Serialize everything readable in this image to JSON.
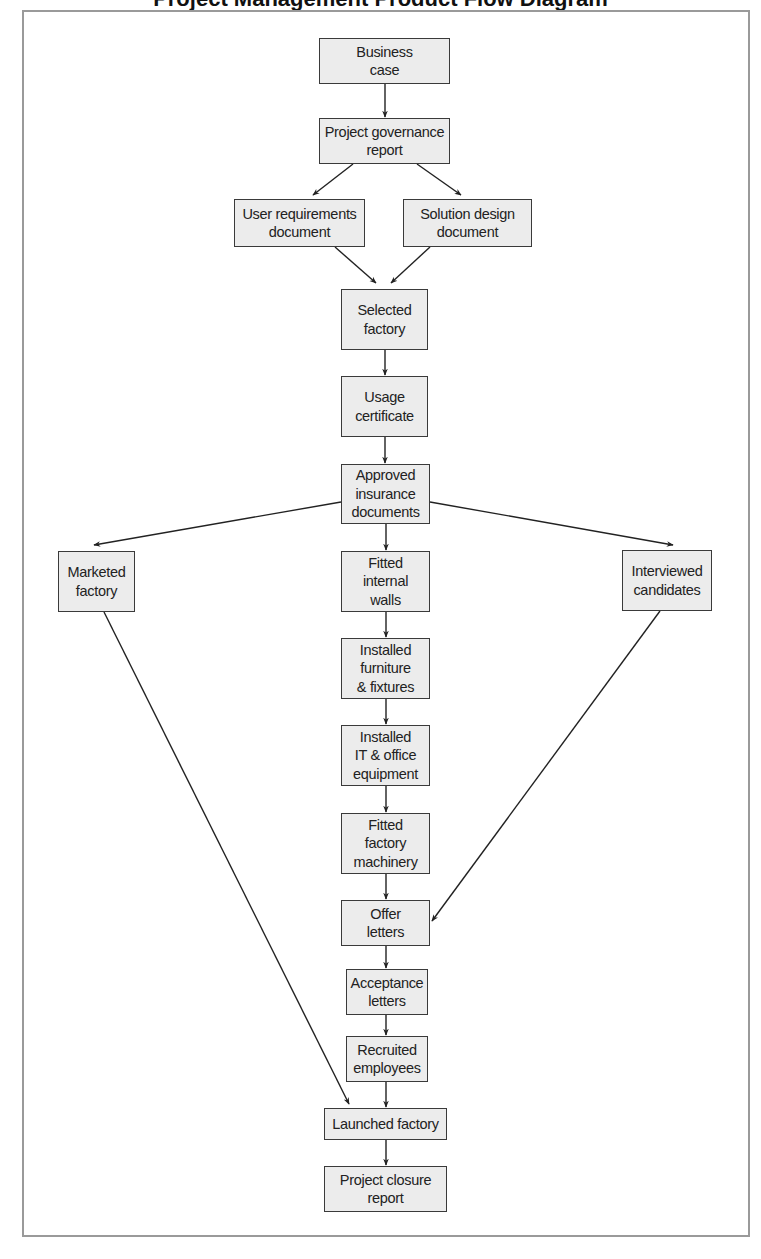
{
  "title": "Project Management Product Flow Diagram",
  "colors": {
    "node_fill": "#ececec",
    "node_border": "#3a3a3a",
    "edge": "#222222",
    "frame": "#9a9a9a"
  },
  "nodes": [
    {
      "id": "business_case",
      "label": "Business\ncase",
      "x": 319,
      "y": 38,
      "w": 131,
      "h": 46
    },
    {
      "id": "project_governance_report",
      "label": "Project governance\nreport",
      "x": 319,
      "y": 118,
      "w": 131,
      "h": 46
    },
    {
      "id": "user_requirements_document",
      "label": "User requirements\ndocument",
      "x": 234,
      "y": 199,
      "w": 131,
      "h": 48
    },
    {
      "id": "solution_design_document",
      "label": "Solution design\ndocument",
      "x": 403,
      "y": 199,
      "w": 129,
      "h": 48
    },
    {
      "id": "selected_factory",
      "label": "Selected\nfactory",
      "x": 341,
      "y": 289,
      "w": 87,
      "h": 61
    },
    {
      "id": "usage_certificate",
      "label": "Usage\ncertificate",
      "x": 341,
      "y": 376,
      "w": 87,
      "h": 61
    },
    {
      "id": "approved_insurance_documents",
      "label": "Approved\ninsurance\ndocuments",
      "x": 341,
      "y": 464,
      "w": 89,
      "h": 60
    },
    {
      "id": "marketed_factory",
      "label": "Marketed\nfactory",
      "x": 58,
      "y": 551,
      "w": 77,
      "h": 61
    },
    {
      "id": "fitted_internal_walls",
      "label": "Fitted\ninternal\nwalls",
      "x": 341,
      "y": 551,
      "w": 89,
      "h": 61
    },
    {
      "id": "interviewed_candidates",
      "label": "Interviewed\ncandidates",
      "x": 622,
      "y": 550,
      "w": 90,
      "h": 61
    },
    {
      "id": "installed_furniture_fixtures",
      "label": "Installed\nfurniture\n& fixtures",
      "x": 341,
      "y": 638,
      "w": 89,
      "h": 61
    },
    {
      "id": "installed_it_office_equipment",
      "label": "Installed\nIT & office\nequipment",
      "x": 341,
      "y": 725,
      "w": 89,
      "h": 61
    },
    {
      "id": "fitted_factory_machinery",
      "label": "Fitted\nfactory\nmachinery",
      "x": 341,
      "y": 813,
      "w": 89,
      "h": 61
    },
    {
      "id": "offer_letters",
      "label": "Offer\nletters",
      "x": 341,
      "y": 900,
      "w": 89,
      "h": 46
    },
    {
      "id": "acceptance_letters",
      "label": "Acceptance\nletters",
      "x": 346,
      "y": 969,
      "w": 82,
      "h": 46
    },
    {
      "id": "recruited_employees",
      "label": "Recruited\nemployees",
      "x": 346,
      "y": 1036,
      "w": 82,
      "h": 46
    },
    {
      "id": "launched_factory",
      "label": "Launched factory",
      "x": 324,
      "y": 1108,
      "w": 123,
      "h": 32
    },
    {
      "id": "project_closure_report",
      "label": "Project closure\nreport",
      "x": 324,
      "y": 1166,
      "w": 123,
      "h": 46
    }
  ],
  "edges": [
    {
      "from": "business_case",
      "to": "project_governance_report",
      "x1": 385,
      "y1": 84,
      "x2": 385,
      "y2": 117
    },
    {
      "from": "project_governance_report",
      "to": "user_requirements_document",
      "x1": 353,
      "y1": 164,
      "x2": 313,
      "y2": 195
    },
    {
      "from": "project_governance_report",
      "to": "solution_design_document",
      "x1": 417,
      "y1": 164,
      "x2": 461,
      "y2": 195
    },
    {
      "from": "user_requirements_document",
      "to": "selected_factory",
      "x1": 335,
      "y1": 247,
      "x2": 376,
      "y2": 283
    },
    {
      "from": "solution_design_document",
      "to": "selected_factory",
      "x1": 430,
      "y1": 247,
      "x2": 391,
      "y2": 283
    },
    {
      "from": "selected_factory",
      "to": "usage_certificate",
      "x1": 385,
      "y1": 350,
      "x2": 385,
      "y2": 375
    },
    {
      "from": "usage_certificate",
      "to": "approved_insurance_documents",
      "x1": 385,
      "y1": 437,
      "x2": 385,
      "y2": 463
    },
    {
      "from": "approved_insurance_documents",
      "to": "marketed_factory",
      "x1": 341,
      "y1": 502,
      "x2": 94,
      "y2": 545
    },
    {
      "from": "approved_insurance_documents",
      "to": "fitted_internal_walls",
      "x1": 386,
      "y1": 524,
      "x2": 386,
      "y2": 550
    },
    {
      "from": "approved_insurance_documents",
      "to": "interviewed_candidates",
      "x1": 430,
      "y1": 502,
      "x2": 673,
      "y2": 545
    },
    {
      "from": "fitted_internal_walls",
      "to": "installed_furniture_fixtures",
      "x1": 386,
      "y1": 612,
      "x2": 386,
      "y2": 637
    },
    {
      "from": "installed_furniture_fixtures",
      "to": "installed_it_office_equipment",
      "x1": 386,
      "y1": 699,
      "x2": 386,
      "y2": 724
    },
    {
      "from": "installed_it_office_equipment",
      "to": "fitted_factory_machinery",
      "x1": 386,
      "y1": 786,
      "x2": 386,
      "y2": 812
    },
    {
      "from": "fitted_factory_machinery",
      "to": "offer_letters",
      "x1": 386,
      "y1": 874,
      "x2": 386,
      "y2": 899
    },
    {
      "from": "interviewed_candidates",
      "to": "offer_letters",
      "x1": 660,
      "y1": 611,
      "x2": 432,
      "y2": 921
    },
    {
      "from": "offer_letters",
      "to": "acceptance_letters",
      "x1": 386,
      "y1": 946,
      "x2": 386,
      "y2": 968
    },
    {
      "from": "acceptance_letters",
      "to": "recruited_employees",
      "x1": 386,
      "y1": 1015,
      "x2": 386,
      "y2": 1035
    },
    {
      "from": "recruited_employees",
      "to": "launched_factory",
      "x1": 386,
      "y1": 1082,
      "x2": 386,
      "y2": 1107
    },
    {
      "from": "marketed_factory",
      "to": "launched_factory",
      "x1": 104,
      "y1": 612,
      "x2": 349,
      "y2": 1104
    },
    {
      "from": "launched_factory",
      "to": "project_closure_report",
      "x1": 386,
      "y1": 1140,
      "x2": 386,
      "y2": 1165
    }
  ]
}
